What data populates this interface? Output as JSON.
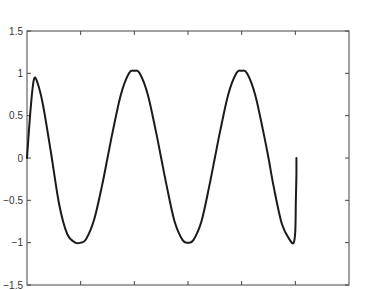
{
  "chart_data": {
    "type": "line",
    "title": "",
    "xlabel": "",
    "ylabel": "",
    "xlim": [
      0,
      6
    ],
    "ylim": [
      -1.5,
      1.5
    ],
    "grid": false,
    "legend": null,
    "x_ticks": [
      1,
      2,
      3,
      4,
      5
    ],
    "x_tick_labels": [
      "",
      "",
      "",
      "",
      ""
    ],
    "y_ticks": [
      1.5,
      1,
      0.5,
      0,
      -0.5,
      -1,
      -1.5
    ],
    "y_tick_labels": [
      "1.5",
      "1",
      "0.5",
      "0",
      "−0.5",
      "−1",
      "−1.5"
    ],
    "series": [
      {
        "name": "signal",
        "color": "#1a1a1a",
        "x": [
          0,
          0.07,
          0.13,
          0.2,
          0.3,
          0.45,
          0.6,
          0.75,
          0.9,
          1.0,
          1.1,
          1.25,
          1.4,
          1.5,
          1.6,
          1.75,
          1.9,
          2.0,
          2.1,
          2.25,
          2.4,
          2.5,
          2.6,
          2.75,
          2.9,
          3.0,
          3.1,
          3.25,
          3.4,
          3.5,
          3.6,
          3.75,
          3.9,
          4.0,
          4.1,
          4.25,
          4.4,
          4.5,
          4.6,
          4.75,
          4.9,
          4.97,
          5.0,
          5.01,
          5.02,
          5.02
        ],
        "y": [
          0,
          0.6,
          0.93,
          0.88,
          0.62,
          0.05,
          -0.55,
          -0.9,
          -1.0,
          -1.0,
          -0.96,
          -0.73,
          -0.32,
          0.0,
          0.32,
          0.75,
          1.0,
          1.03,
          1.0,
          0.75,
          0.32,
          0.0,
          -0.32,
          -0.75,
          -0.97,
          -1.0,
          -0.97,
          -0.75,
          -0.32,
          0.0,
          0.32,
          0.75,
          1.0,
          1.03,
          1.0,
          0.75,
          0.32,
          0.0,
          -0.35,
          -0.78,
          -0.97,
          -1.0,
          -0.85,
          -0.5,
          -0.2,
          0.0
        ]
      }
    ]
  }
}
